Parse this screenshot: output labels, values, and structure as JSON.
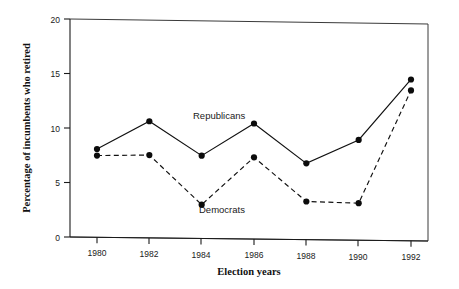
{
  "chart_data": {
    "type": "line",
    "title": "",
    "xlabel": "Election years",
    "ylabel": "Percentage of incumbents who retired",
    "categories": [
      1980,
      1982,
      1984,
      1986,
      1988,
      1990,
      1992
    ],
    "xtick_labels": [
      "1980",
      "1982",
      "1984",
      "1986",
      "1988",
      "1990",
      "1992"
    ],
    "ytick_labels": [
      "0",
      "5",
      "10",
      "15",
      "20"
    ],
    "yticks": [
      0,
      5,
      10,
      15,
      20
    ],
    "ylim": [
      0,
      20
    ],
    "xlim": [
      1979.2,
      1993.2
    ],
    "grid": false,
    "legend_position": "inline-annotations",
    "series": [
      {
        "name": "Republicans",
        "style": "solid",
        "marker": "filled-circle",
        "values": [
          8.1,
          10.7,
          7.6,
          10.6,
          7.0,
          9.2,
          14.8
        ],
        "annotation": {
          "text": "Republicans",
          "x": 1985.0,
          "y": 11.6
        }
      },
      {
        "name": "Democrats",
        "style": "dashed",
        "marker": "filled-circle",
        "values": [
          7.5,
          7.6,
          3.1,
          7.5,
          3.5,
          3.4,
          13.8
        ],
        "annotation": {
          "text": "Democrats",
          "x": 1984.2,
          "y": 2.2
        }
      }
    ]
  },
  "colors": {
    "series_line": "#111111",
    "marker": "#0c0c0c",
    "axis": "#1a1a1a",
    "background": "#ffffff"
  }
}
